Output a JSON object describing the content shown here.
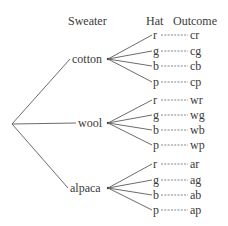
{
  "headers": {
    "sweater": "Sweater",
    "hat": "Hat",
    "outcome": "Outcome"
  },
  "colors": {
    "line": "#5a5a5a",
    "text": "#3a3a3a"
  },
  "root": {
    "x": 12,
    "y": 124
  },
  "sweaters": [
    {
      "label": "cotton",
      "x": 72,
      "y": 63,
      "apex": {
        "x": 108,
        "y": 59
      },
      "hats": [
        {
          "label": "r",
          "outcome": "cr",
          "y": 35
        },
        {
          "label": "g",
          "outcome": "cg",
          "y": 51
        },
        {
          "label": "b",
          "outcome": "cb",
          "y": 66
        },
        {
          "label": "p",
          "outcome": "cp",
          "y": 82
        }
      ]
    },
    {
      "label": "wool",
      "x": 78,
      "y": 127,
      "apex": {
        "x": 108,
        "y": 123
      },
      "hats": [
        {
          "label": "r",
          "outcome": "wr",
          "y": 100
        },
        {
          "label": "g",
          "outcome": "wg",
          "y": 115
        },
        {
          "label": "b",
          "outcome": "wb",
          "y": 130
        },
        {
          "label": "p",
          "outcome": "wp",
          "y": 145
        }
      ]
    },
    {
      "label": "alpaca",
      "x": 70,
      "y": 192,
      "apex": {
        "x": 108,
        "y": 188
      },
      "hats": [
        {
          "label": "r",
          "outcome": "ar",
          "y": 164
        },
        {
          "label": "g",
          "outcome": "ag",
          "y": 180
        },
        {
          "label": "b",
          "outcome": "ab",
          "y": 195
        },
        {
          "label": "p",
          "outcome": "ap",
          "y": 210
        }
      ]
    }
  ]
}
